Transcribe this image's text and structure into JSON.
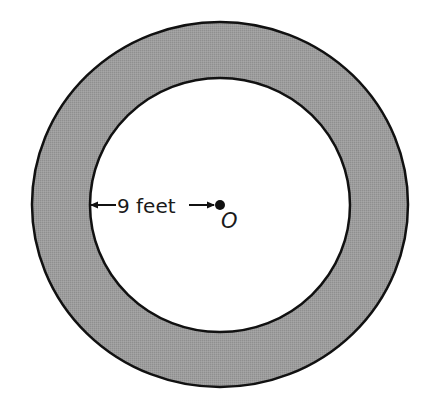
{
  "diagram": {
    "type": "annulus",
    "outer_circle": {
      "cx": 220,
      "cy": 204.5,
      "rx": 188,
      "ry": 182.5
    },
    "inner_circle": {
      "cx": 220,
      "cy": 205,
      "rx": 130,
      "ry": 127
    },
    "ring_fill_color": "#9b9b9b",
    "inner_fill_color": "#ffffff",
    "stroke_color": "#111111",
    "radius_label": "9 feet",
    "center_label": "O",
    "center_point": {
      "cx": 220,
      "cy": 205
    }
  }
}
